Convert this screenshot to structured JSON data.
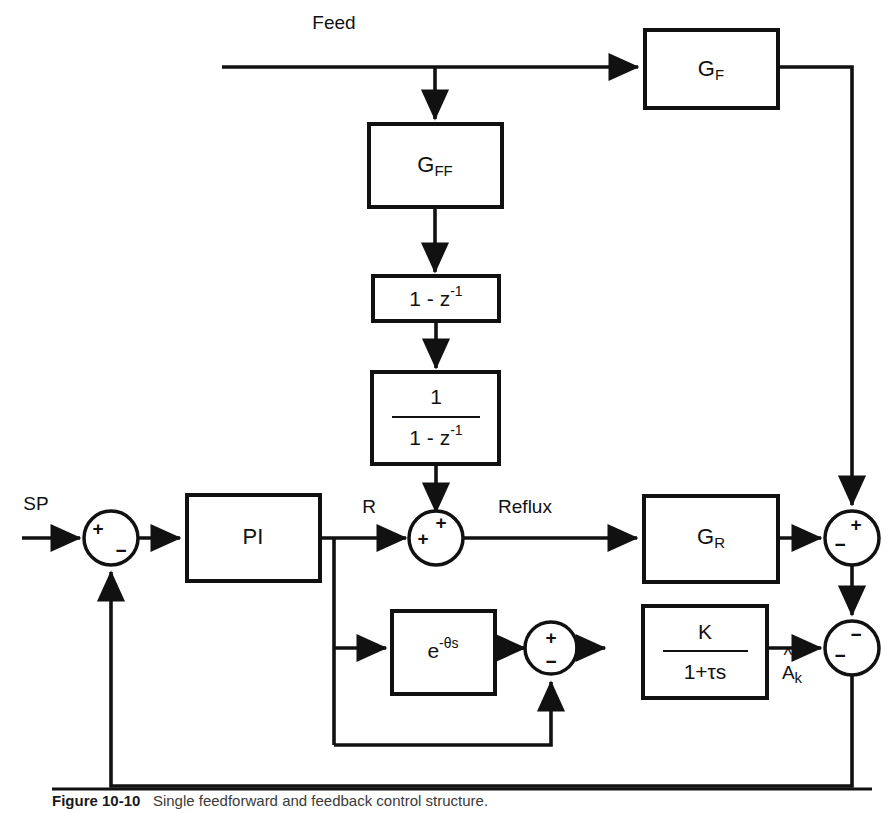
{
  "figure": {
    "caption_number": "Figure 10-10",
    "caption_text": "Single feedforward and feedback control structure."
  },
  "signals": {
    "feed": "Feed",
    "sp": "SP",
    "r": "R",
    "reflux": "Reflux",
    "a_hat_k_base": "A",
    "a_hat_k_sub": "k"
  },
  "blocks": {
    "gff": {
      "base": "G",
      "sub": "FF"
    },
    "gf": {
      "base": "G",
      "sub": "F"
    },
    "gr": {
      "base": "G",
      "sub": "R"
    },
    "pi": {
      "label": "PI"
    },
    "differencer": {
      "label": "1 - z",
      "sup": "-1"
    },
    "integrator": {
      "numerator": "1",
      "denominator": "1 - z",
      "denominator_sup": "-1"
    },
    "deadtime": {
      "base": "e",
      "exponent": "-θs"
    },
    "firstorder": {
      "numerator": "K",
      "denominator": "1+τs"
    }
  },
  "junctions": {
    "sp_error": {
      "name": "sp-summing-junction",
      "top_left_sign": "+",
      "bottom_right_sign": "−"
    },
    "reflux": {
      "name": "reflux-summing-junction",
      "top_sign": "+",
      "left_sign": "+"
    },
    "output_upper": {
      "name": "output-upper-summing-junction",
      "top_sign": "+",
      "left_sign": "−"
    },
    "model_error": {
      "name": "model-error-summing-junction",
      "top_sign": "+",
      "bottom_sign": "−"
    },
    "output_lower": {
      "name": "output-lower-summing-junction",
      "top_sign": "−",
      "left_sign": "−"
    }
  },
  "colors": {
    "line": "#111111",
    "background": "#ffffff"
  }
}
